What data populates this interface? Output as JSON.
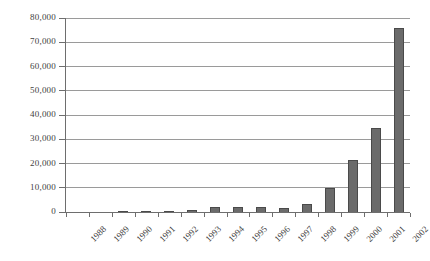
{
  "chart_data": {
    "type": "bar",
    "title": "",
    "subtitle": "",
    "xlabel": "",
    "ylabel": "",
    "categories": [
      "1988",
      "1989",
      "1990",
      "1991",
      "1992",
      "1993",
      "1994",
      "1995",
      "1996",
      "1997",
      "1998",
      "1999",
      "2000",
      "2001",
      "2002"
    ],
    "values": [
      0,
      150,
      180,
      300,
      550,
      950,
      2000,
      2000,
      1950,
      1600,
      3300,
      9700,
      21500,
      34500,
      75800
    ],
    "series": [
      {
        "name": "",
        "values": [
          0,
          150,
          180,
          300,
          550,
          950,
          2000,
          2000,
          1950,
          1600,
          3300,
          9700,
          21500,
          34500,
          75800
        ]
      }
    ],
    "ylim": [
      0,
      80000
    ],
    "ytick_values": [
      0,
      10000,
      20000,
      30000,
      40000,
      50000,
      60000,
      70000,
      80000
    ],
    "ytick_labels": [
      "0",
      "10,000",
      "20,000",
      "30,000",
      "40,000",
      "50,000",
      "60,000",
      "70,000",
      "80,000"
    ],
    "grid": true,
    "grid_axis": "y",
    "legend": false,
    "legend_position": "none",
    "bar_color": "#6b6b6b",
    "bar_edge_color": "#4a4a4a",
    "gridline_color": "#9a9a9a",
    "axis_color": "#6e6e6e",
    "background_color": "#ffffff",
    "text_color": "#3f3f3f",
    "xtick_label_rotation": -45,
    "annotations": []
  }
}
